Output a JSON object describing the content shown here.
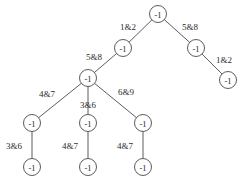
{
  "figure": {
    "name": "decision-tree-diagram",
    "type": "tree",
    "width": 247,
    "height": 189,
    "background_color": "#ffffff",
    "stroke_color": "#4a4a4a",
    "text_color": "#2b2b2b",
    "node_radius": 8.5
  },
  "tree_data": {
    "node_label_default": "-1",
    "nodes": [
      {
        "id": "n0",
        "label": "-1",
        "x": 158,
        "y": 14,
        "depth": 0
      },
      {
        "id": "n1",
        "label": "-1",
        "x": 123,
        "y": 48,
        "depth": 1
      },
      {
        "id": "n2",
        "label": "-1",
        "x": 196,
        "y": 48,
        "depth": 1
      },
      {
        "id": "n3",
        "label": "-1",
        "x": 88,
        "y": 78,
        "depth": 2
      },
      {
        "id": "n4",
        "label": "-1",
        "x": 228,
        "y": 80,
        "depth": 2
      },
      {
        "id": "n5",
        "label": "-1",
        "x": 32,
        "y": 123,
        "depth": 3
      },
      {
        "id": "n6",
        "label": "-1",
        "x": 88,
        "y": 123,
        "depth": 3
      },
      {
        "id": "n7",
        "label": "-1",
        "x": 143,
        "y": 123,
        "depth": 3
      },
      {
        "id": "n8",
        "label": "-1",
        "x": 32,
        "y": 167,
        "depth": 4
      },
      {
        "id": "n9",
        "label": "-1",
        "x": 88,
        "y": 167,
        "depth": 4
      },
      {
        "id": "n10",
        "label": "-1",
        "x": 143,
        "y": 167,
        "depth": 4
      }
    ],
    "edges": [
      {
        "from": "n0",
        "to": "n1",
        "label": "1&2",
        "label_x": 128,
        "label_y": 27
      },
      {
        "from": "n0",
        "to": "n2",
        "label": "5&8",
        "label_x": 190,
        "label_y": 27
      },
      {
        "from": "n1",
        "to": "n3",
        "label": "5&8",
        "label_x": 94,
        "label_y": 57
      },
      {
        "from": "n2",
        "to": "n4",
        "label": "1&2",
        "label_x": 224,
        "label_y": 60
      },
      {
        "from": "n3",
        "to": "n5",
        "label": "4&7",
        "label_x": 47,
        "label_y": 94
      },
      {
        "from": "n3",
        "to": "n6",
        "label": "3&6",
        "label_x": 88,
        "label_y": 105
      },
      {
        "from": "n3",
        "to": "n7",
        "label": "6&9",
        "label_x": 126,
        "label_y": 92
      },
      {
        "from": "n5",
        "to": "n8",
        "label": "3&6",
        "label_x": 14,
        "label_y": 146
      },
      {
        "from": "n6",
        "to": "n9",
        "label": "4&7",
        "label_x": 70,
        "label_y": 146
      },
      {
        "from": "n7",
        "to": "n10",
        "label": "4&7",
        "label_x": 125,
        "label_y": 146
      }
    ],
    "edge_labels_list": [
      "1&2",
      "5&8",
      "5&8",
      "1&2",
      "4&7",
      "3&6",
      "6&9",
      "3&6",
      "4&7",
      "4&7"
    ],
    "all_node_labels": [
      "-1",
      "-1",
      "-1",
      "-1",
      "-1",
      "-1",
      "-1",
      "-1",
      "-1",
      "-1",
      "-1"
    ]
  }
}
